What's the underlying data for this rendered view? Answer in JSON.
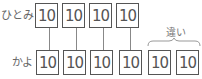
{
  "diagram": {
    "rows": [
      {
        "label": "ひとみ",
        "values": [
          "10",
          "10",
          "10",
          "10"
        ]
      },
      {
        "label": "かよ",
        "values": [
          "10",
          "10",
          "10",
          "10",
          "10",
          "10"
        ]
      }
    ],
    "brace_label": "違い"
  }
}
